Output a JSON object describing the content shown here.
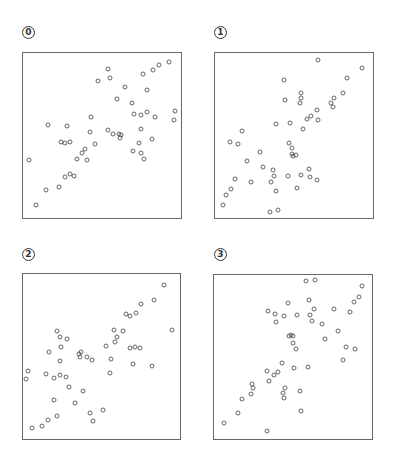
{
  "chart_data": [
    {
      "type": "scatter",
      "title": "0",
      "label": "0",
      "xlabel": "",
      "ylabel": "",
      "axes_visible": false,
      "grid": false,
      "legend": null,
      "box": {
        "x": 22,
        "y": 52,
        "w": 159,
        "h": 166
      },
      "marker": "open-circle",
      "points_px": [
        [
          169,
          62
        ],
        [
          159,
          65
        ],
        [
          153,
          70
        ],
        [
          143,
          74
        ],
        [
          108,
          69
        ],
        [
          110,
          78
        ],
        [
          98,
          81
        ],
        [
          125,
          87
        ],
        [
          147,
          90
        ],
        [
          117,
          99
        ],
        [
          132,
          103
        ],
        [
          134,
          114
        ],
        [
          141,
          115
        ],
        [
          147,
          112
        ],
        [
          155,
          117
        ],
        [
          175,
          111
        ],
        [
          174,
          120
        ],
        [
          91,
          117
        ],
        [
          48,
          125
        ],
        [
          67,
          126
        ],
        [
          90,
          132
        ],
        [
          108,
          130
        ],
        [
          113,
          134
        ],
        [
          119,
          134
        ],
        [
          121,
          135
        ],
        [
          120,
          138
        ],
        [
          141,
          129
        ],
        [
          152,
          139
        ],
        [
          139,
          143
        ],
        [
          133,
          151
        ],
        [
          141,
          153
        ],
        [
          144,
          159
        ],
        [
          61,
          142
        ],
        [
          65,
          143
        ],
        [
          70,
          142
        ],
        [
          95,
          144
        ],
        [
          85,
          149
        ],
        [
          82,
          153
        ],
        [
          77,
          159
        ],
        [
          87,
          160
        ],
        [
          29,
          160
        ],
        [
          65,
          177
        ],
        [
          70,
          174
        ],
        [
          74,
          176
        ],
        [
          59,
          187
        ],
        [
          46,
          190
        ],
        [
          36,
          205
        ]
      ]
    },
    {
      "type": "scatter",
      "title": "1",
      "label": "1",
      "xlabel": "",
      "ylabel": "",
      "axes_visible": false,
      "grid": false,
      "legend": null,
      "box": {
        "x": 214,
        "y": 52,
        "w": 159,
        "h": 166
      },
      "marker": "open-circle",
      "points_px": [
        [
          318,
          60
        ],
        [
          362,
          68
        ],
        [
          284,
          80
        ],
        [
          347,
          78
        ],
        [
          343,
          93
        ],
        [
          301,
          93
        ],
        [
          301,
          98
        ],
        [
          300,
          103
        ],
        [
          285,
          100
        ],
        [
          334,
          98
        ],
        [
          331,
          103
        ],
        [
          333,
          107
        ],
        [
          317,
          110
        ],
        [
          311,
          116
        ],
        [
          307,
          119
        ],
        [
          318,
          120
        ],
        [
          276,
          124
        ],
        [
          290,
          123
        ],
        [
          303,
          129
        ],
        [
          242,
          131
        ],
        [
          230,
          142
        ],
        [
          238,
          144
        ],
        [
          289,
          143
        ],
        [
          292,
          148
        ],
        [
          260,
          152
        ],
        [
          292,
          154
        ],
        [
          296,
          155
        ],
        [
          293,
          156
        ],
        [
          247,
          161
        ],
        [
          263,
          167
        ],
        [
          273,
          170
        ],
        [
          274,
          176
        ],
        [
          309,
          169
        ],
        [
          288,
          176
        ],
        [
          301,
          175
        ],
        [
          310,
          177
        ],
        [
          317,
          180
        ],
        [
          251,
          182
        ],
        [
          271,
          182
        ],
        [
          235,
          179
        ],
        [
          231,
          189
        ],
        [
          276,
          191
        ],
        [
          297,
          188
        ],
        [
          226,
          195
        ],
        [
          223,
          205
        ],
        [
          270,
          212
        ],
        [
          278,
          210
        ]
      ]
    },
    {
      "type": "scatter",
      "title": "2",
      "label": "2",
      "xlabel": "",
      "ylabel": "",
      "axes_visible": false,
      "grid": false,
      "legend": null,
      "box": {
        "x": 22,
        "y": 273,
        "w": 158,
        "h": 166
      },
      "marker": "open-circle",
      "points_px": [
        [
          164,
          285
        ],
        [
          154,
          300
        ],
        [
          141,
          304
        ],
        [
          126,
          314
        ],
        [
          130,
          316
        ],
        [
          136,
          313
        ],
        [
          172,
          330
        ],
        [
          114,
          330
        ],
        [
          123,
          331
        ],
        [
          117,
          337
        ],
        [
          115,
          342
        ],
        [
          106,
          346
        ],
        [
          130,
          348
        ],
        [
          135,
          347
        ],
        [
          140,
          348
        ],
        [
          57,
          331
        ],
        [
          60,
          337
        ],
        [
          67,
          339
        ],
        [
          61,
          347
        ],
        [
          49,
          352
        ],
        [
          79,
          354
        ],
        [
          80,
          357
        ],
        [
          81,
          352
        ],
        [
          87,
          357
        ],
        [
          92,
          360
        ],
        [
          111,
          359
        ],
        [
          60,
          361
        ],
        [
          133,
          364
        ],
        [
          152,
          366
        ],
        [
          110,
          373
        ],
        [
          28,
          371
        ],
        [
          26,
          379
        ],
        [
          46,
          374
        ],
        [
          54,
          378
        ],
        [
          60,
          375
        ],
        [
          66,
          377
        ],
        [
          69,
          387
        ],
        [
          83,
          391
        ],
        [
          54,
          400
        ],
        [
          75,
          403
        ],
        [
          103,
          410
        ],
        [
          90,
          413
        ],
        [
          93,
          421
        ],
        [
          57,
          416
        ],
        [
          48,
          420
        ],
        [
          42,
          426
        ],
        [
          32,
          428
        ]
      ]
    },
    {
      "type": "scatter",
      "title": "3",
      "label": "3",
      "xlabel": "",
      "ylabel": "",
      "axes_visible": false,
      "grid": false,
      "legend": null,
      "box": {
        "x": 213,
        "y": 274,
        "w": 159,
        "h": 165
      },
      "marker": "open-circle",
      "points_px": [
        [
          306,
          281
        ],
        [
          315,
          280
        ],
        [
          362,
          286
        ],
        [
          359,
          297
        ],
        [
          354,
          302
        ],
        [
          350,
          312
        ],
        [
          288,
          303
        ],
        [
          309,
          300
        ],
        [
          314,
          309
        ],
        [
          334,
          309
        ],
        [
          268,
          311
        ],
        [
          275,
          314
        ],
        [
          284,
          316
        ],
        [
          297,
          315
        ],
        [
          310,
          315
        ],
        [
          312,
          321
        ],
        [
          276,
          322
        ],
        [
          322,
          324
        ],
        [
          338,
          331
        ],
        [
          289,
          336
        ],
        [
          291,
          335
        ],
        [
          293,
          336
        ],
        [
          325,
          339
        ],
        [
          293,
          343
        ],
        [
          296,
          349
        ],
        [
          346,
          347
        ],
        [
          355,
          349
        ],
        [
          343,
          360
        ],
        [
          282,
          363
        ],
        [
          294,
          368
        ],
        [
          308,
          367
        ],
        [
          267,
          371
        ],
        [
          278,
          372
        ],
        [
          274,
          375
        ],
        [
          269,
          381
        ],
        [
          252,
          384
        ],
        [
          253,
          388
        ],
        [
          251,
          394
        ],
        [
          285,
          388
        ],
        [
          283,
          393
        ],
        [
          284,
          398
        ],
        [
          300,
          391
        ],
        [
          242,
          399
        ],
        [
          301,
          411
        ],
        [
          238,
          413
        ],
        [
          224,
          423
        ],
        [
          267,
          431
        ]
      ]
    }
  ],
  "colors": {
    "marker_stroke": "#555555",
    "box_stroke": "#666666",
    "background": "#ffffff"
  },
  "labels": {
    "p0": "0",
    "p1": "1",
    "p2": "2",
    "p3": "3"
  }
}
